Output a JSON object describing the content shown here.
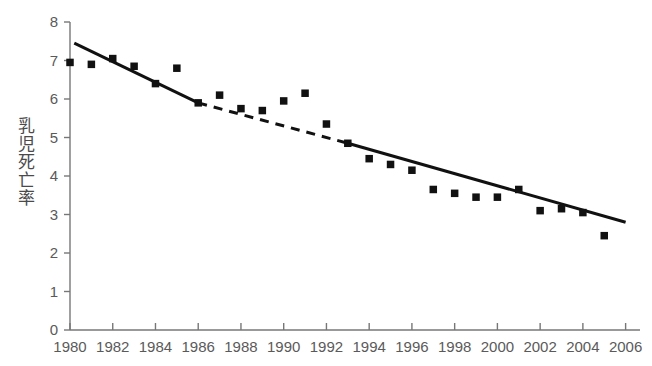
{
  "chart_data": {
    "type": "scatter",
    "title": "",
    "subtitle": "",
    "xlabel": "",
    "ylabel": "乳児死亡率",
    "xlim": [
      1979.3,
      1986.0
    ],
    "ylim": [
      0,
      8
    ],
    "grid": false,
    "legend": "none",
    "x_ticks": [
      "1980",
      "1982",
      "1984",
      "1986",
      "1988",
      "1990",
      "1992",
      "1994",
      "1996",
      "1998",
      "2000",
      "2002",
      "2004",
      "2006"
    ],
    "x_tick_values": [
      1980,
      1982,
      1984,
      1986,
      1988,
      1990,
      1992,
      1994,
      1996,
      1998,
      2000,
      2002,
      2004,
      2006
    ],
    "y_ticks": [
      "0",
      "1",
      "2",
      "3",
      "4",
      "5",
      "6",
      "7",
      "8"
    ],
    "y_tick_values": [
      0,
      1,
      2,
      3,
      4,
      5,
      6,
      7,
      8
    ],
    "x": [
      1980,
      1981,
      1982,
      1983,
      1984,
      1985,
      1986,
      1987,
      1988,
      1989,
      1990,
      1991,
      1992,
      1993,
      1994,
      1995,
      1996,
      1997,
      1998,
      1999,
      2000,
      2001,
      2002,
      2003,
      2004,
      2005
    ],
    "values": [
      6.95,
      6.9,
      7.05,
      6.85,
      6.4,
      6.8,
      5.9,
      6.1,
      5.75,
      5.7,
      5.95,
      6.15,
      5.35,
      4.85,
      4.45,
      4.3,
      4.15,
      3.65,
      3.55,
      3.45,
      3.45,
      3.65,
      3.1,
      3.15,
      3.05,
      2.45
    ],
    "series": [
      {
        "name": "乳児死亡率",
        "marker": "square",
        "color": "#111111",
        "values": [
          6.95,
          6.9,
          7.05,
          6.85,
          6.4,
          6.8,
          5.9,
          6.1,
          5.75,
          5.7,
          5.95,
          6.15,
          5.35,
          4.85,
          4.45,
          4.3,
          4.15,
          3.65,
          3.55,
          3.45,
          3.45,
          3.65,
          3.1,
          3.15,
          3.05,
          2.45
        ]
      },
      {
        "name": "trend-solid-early",
        "style": "solid",
        "color": "#111111",
        "x": [
          1980.2,
          1986.0
        ],
        "values": [
          7.45,
          5.9
        ]
      },
      {
        "name": "trend-dashed-middle",
        "style": "dashed",
        "color": "#111111",
        "x": [
          1986.0,
          1993.0
        ],
        "values": [
          5.9,
          4.85
        ]
      },
      {
        "name": "trend-solid-late",
        "style": "solid",
        "color": "#111111",
        "x": [
          1993.0,
          2006.0
        ],
        "values": [
          4.85,
          2.8
        ]
      }
    ],
    "axis_color": "#777777",
    "marker_color": "#111111",
    "line_color": "#111111"
  }
}
